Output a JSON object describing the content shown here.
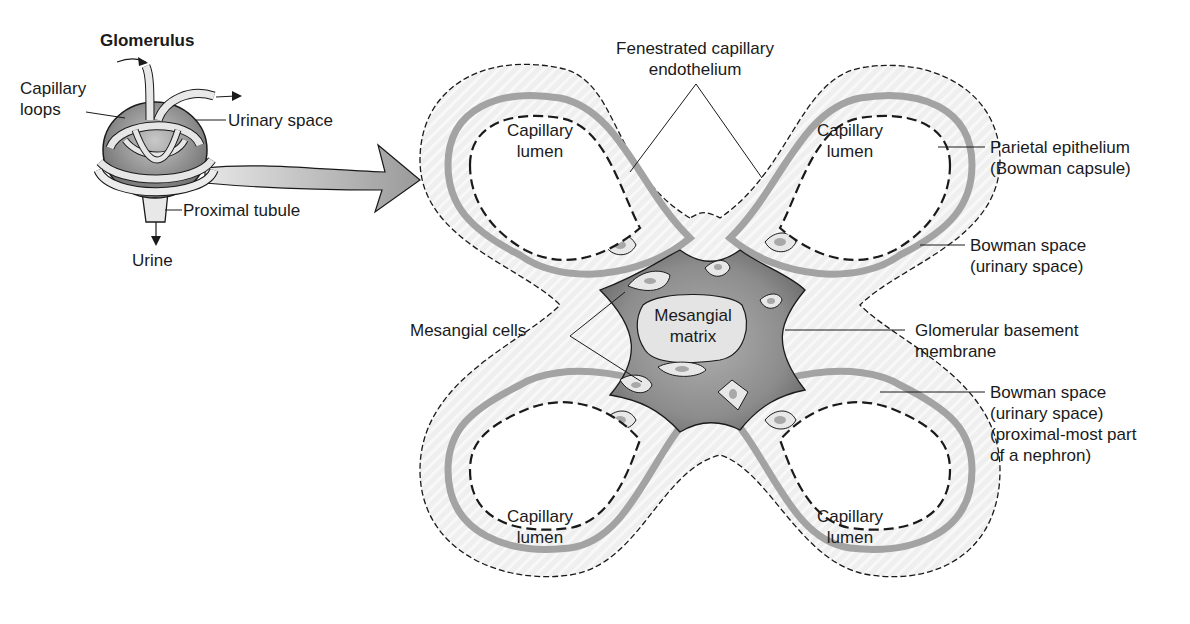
{
  "figure": {
    "type": "anatomical-diagram",
    "colors": {
      "background": "#ffffff",
      "outline": "#1a1a1a",
      "bowman_space_fill": "#ececec",
      "basement_membrane": "#9e9e9e",
      "mesangium_dark": "#6e6e6e",
      "mesangium_mid": "#9a9a9a",
      "cell_fill": "#e6e6e6",
      "nucleus": "#a8a8a8",
      "arrow_fill": "#b5b5b5"
    }
  },
  "inset": {
    "title": "Glomerulus",
    "labels": {
      "capillary_loops": [
        "Capillary",
        "loops"
      ],
      "urinary_space": "Urinary space",
      "proximal_tubule": "Proximal tubule",
      "urine": "Urine"
    }
  },
  "main": {
    "lumen_labels": [
      [
        "Capillary",
        "lumen"
      ],
      [
        "Capillary",
        "lumen"
      ],
      [
        "Capillary",
        "lumen"
      ],
      [
        "Capillary",
        "lumen"
      ]
    ],
    "mesangial_matrix": [
      "Mesangial",
      "matrix"
    ],
    "callouts": {
      "fenestrated": [
        "Fenestrated capillary",
        "endothelium"
      ],
      "parietal": [
        "Parietal epithelium",
        "(Bowman capsule)"
      ],
      "bowman_space_1": [
        "Bowman space",
        "(urinary space)"
      ],
      "gbm": [
        "Glomerular basement",
        "membrane"
      ],
      "bowman_space_2": [
        "Bowman space",
        "(urinary space)",
        "(proximal-most part",
        "of a nephron)"
      ],
      "mesangial_cells": "Mesangial cells"
    }
  }
}
